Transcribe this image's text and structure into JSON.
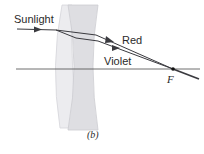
{
  "diagram": {
    "type": "achromatic doublet lens ray diagram",
    "caption": "(b)",
    "labels": {
      "incoming": "Sunlight",
      "ray_red": "Red",
      "ray_violet": "Violet",
      "focal_point": "F"
    },
    "elements": [
      "convex lens",
      "concave lens",
      "optical axis",
      "red ray",
      "violet ray",
      "focal point"
    ],
    "colors": {
      "lens_fill": "#e6e6e9",
      "lens_edge": "#cfcfd4",
      "ray": "#3a3a3f",
      "axis": "#4a4a4a"
    }
  }
}
